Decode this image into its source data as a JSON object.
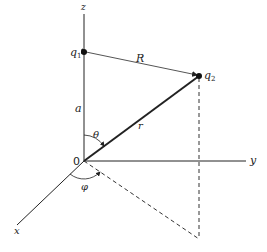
{
  "diagram": {
    "colors": {
      "line": "#222222",
      "dashed": "#333333",
      "background": "#ffffff"
    },
    "axes": {
      "x": {
        "label": "x"
      },
      "y": {
        "label": "y"
      },
      "z": {
        "label": "z"
      }
    },
    "origin": {
      "label": "0"
    },
    "charges": [
      {
        "id": "q1",
        "label": "q",
        "subscript": "1"
      },
      {
        "id": "q2",
        "label": "q",
        "subscript": "2"
      }
    ],
    "distances": {
      "a": "a",
      "R": "R",
      "r": "r"
    },
    "angles": {
      "theta": "θ",
      "phi": "φ"
    }
  }
}
